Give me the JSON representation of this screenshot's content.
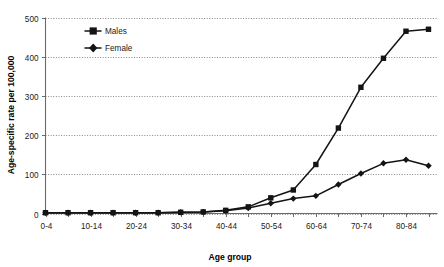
{
  "chart_data": {
    "type": "line",
    "title": "",
    "xlabel": "Age group",
    "ylabel": "Age-specific rate per 100,000",
    "ylim": [
      0,
      500
    ],
    "yticks": [
      0,
      100,
      200,
      300,
      400,
      500
    ],
    "ytick_labels": [
      "0",
      "100",
      "200",
      "300",
      "400",
      "500"
    ],
    "grid": "horizontal-dotted",
    "legend_position": "top-left-inside",
    "categories": [
      "0-4",
      "5-9",
      "10-14",
      "15-19",
      "20-24",
      "25-29",
      "30-34",
      "35-39",
      "40-44",
      "45-49",
      "50-54",
      "55-59",
      "60-64",
      "65-69",
      "70-74",
      "75-79",
      "80-84",
      "85+"
    ],
    "xtick_labels_shown": [
      "0-4",
      "10-14",
      "20-24",
      "30-34",
      "40-44",
      "50-54",
      "60-64",
      "70-74",
      "80-84"
    ],
    "series": [
      {
        "name": "Males",
        "marker": "square",
        "color": "#141414",
        "values": [
          2,
          2,
          2,
          2,
          2,
          2,
          3,
          4,
          8,
          17,
          40,
          60,
          125,
          218,
          322,
          396,
          465,
          470
        ]
      },
      {
        "name": "Female",
        "marker": "diamond",
        "color": "#141414",
        "values": [
          2,
          2,
          2,
          2,
          2,
          2,
          3,
          4,
          7,
          14,
          26,
          38,
          45,
          74,
          102,
          128,
          137,
          122
        ]
      }
    ],
    "series_tail": {
      "males_last": 410,
      "female_last": 70
    },
    "legend_entries": [
      "Males",
      "Female"
    ]
  },
  "axis": {
    "x_title": "Age group",
    "y_title": "Age-specific rate per 100,000"
  },
  "legend": {
    "males_label": "Males",
    "female_label": "Female"
  }
}
